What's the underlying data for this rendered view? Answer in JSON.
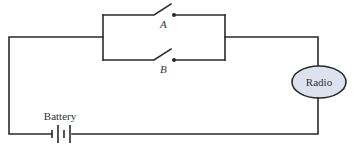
{
  "diagram": {
    "type": "electrical-circuit",
    "components": {
      "switch_a": {
        "label": "A",
        "state": "open"
      },
      "switch_b": {
        "label": "B",
        "state": "open"
      },
      "radio": {
        "label": "Radio",
        "fill": "#dde3ee"
      },
      "battery": {
        "label": "Battery"
      }
    },
    "connections": [
      "battery -> left wire -> parallel switches (A, B)",
      "parallel switches -> radio",
      "radio -> battery"
    ]
  }
}
